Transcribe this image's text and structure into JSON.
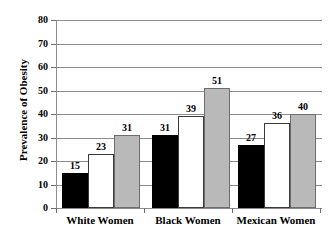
{
  "chart_data": {
    "type": "bar",
    "title": "",
    "xlabel": "",
    "ylabel": "Prevalence of Obesity",
    "ylim": [
      0,
      80
    ],
    "ytick_labels": [
      "80",
      "70",
      "60",
      "50",
      "40",
      "30",
      "20",
      "10",
      "0"
    ],
    "ytick_values": [
      80,
      70,
      60,
      50,
      40,
      30,
      20,
      10,
      0
    ],
    "grid": true,
    "legend": "none",
    "categories": [
      "White Women",
      "Black Women",
      "Mexican Women"
    ],
    "series": [
      {
        "name": "series-1",
        "color": "#000000",
        "values": [
          15,
          31,
          27
        ]
      },
      {
        "name": "series-2",
        "color": "#ffffff",
        "values": [
          23,
          39,
          36
        ]
      },
      {
        "name": "series-3",
        "color": "#b9b9b9",
        "values": [
          31,
          51,
          40
        ]
      }
    ],
    "data_labels": [
      [
        "15",
        "23",
        "31"
      ],
      [
        "31",
        "39",
        "51"
      ],
      [
        "27",
        "36",
        "40"
      ]
    ]
  },
  "colors": {
    "axis": "#8d8d8d",
    "grid": "#8d8d8d",
    "bar_black": "#000000",
    "bar_white": "#ffffff",
    "bar_gray": "#b9b9b9",
    "text": "#000000",
    "background": "#ffffff"
  }
}
